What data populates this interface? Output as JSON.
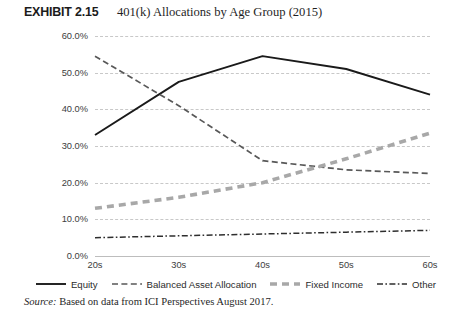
{
  "header": {
    "exhibit_number": "EXHIBIT 2.15",
    "title": "401(k) Allocations by Age Group (2015)"
  },
  "source": {
    "prefix": "Source:",
    "text": " Based on data from ICI Perspectives August 2017."
  },
  "colors": {
    "equity": "#1a1a1a",
    "balanced": "#585858",
    "fixed_income": "#a8a8a8",
    "other": "#2e2e2e",
    "gridline": "#c8c8c8",
    "axis": "#bdbdbd",
    "text": "#3d3d3d"
  },
  "chart_data": {
    "type": "line",
    "title": "401(k) Allocations by Age Group (2015)",
    "xlabel": "",
    "ylabel": "",
    "categories": [
      "20s",
      "30s",
      "40s",
      "50s",
      "60s"
    ],
    "ylim": [
      0,
      60
    ],
    "ytick_labels": [
      "60.0%",
      "50.0%",
      "40.0%",
      "30.0%",
      "20.0%",
      "10.0%",
      "0.0%"
    ],
    "ytick_values": [
      60,
      50,
      40,
      30,
      20,
      10,
      0
    ],
    "grid": true,
    "legend_position": "bottom",
    "series": [
      {
        "name": "Equity",
        "style": "solid",
        "color": "#1a1a1a",
        "values": [
          33.0,
          47.5,
          54.5,
          51.0,
          44.0
        ]
      },
      {
        "name": "Balanced Asset Allocation",
        "style": "dashed",
        "color": "#585858",
        "values": [
          54.5,
          41.0,
          26.0,
          23.5,
          22.5
        ]
      },
      {
        "name": "Fixed Income",
        "style": "thick-dashed",
        "color": "#a8a8a8",
        "values": [
          13.0,
          16.0,
          20.0,
          26.5,
          33.5
        ]
      },
      {
        "name": "Other",
        "style": "dash-dot",
        "color": "#2e2e2e",
        "values": [
          5.0,
          5.5,
          6.0,
          6.5,
          7.0
        ]
      }
    ]
  }
}
